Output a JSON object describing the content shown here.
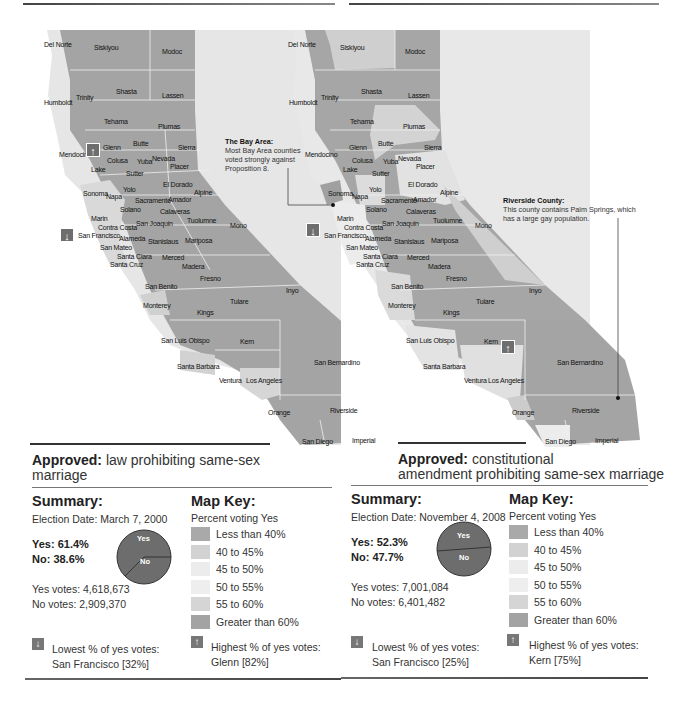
{
  "maps": [
    {
      "id": "prop22-2000",
      "approved_label": "Approved:",
      "approved_text": "law prohibiting same-sex marriage",
      "summary": {
        "title": "Summary:",
        "election_date": "Election Date: March 7, 2000",
        "yes_pct": "Yes: 61.4%",
        "no_pct": "No:  38.6%",
        "yes_votes": "Yes votes: 4,618,673",
        "no_votes": "No votes:  2,909,370",
        "pie_yes_label": "Yes",
        "pie_no_label": "No",
        "pie_yes_value": 61.4,
        "pie_no_value": 38.6
      },
      "key": {
        "title": "Map Key:",
        "subtitle": "Percent voting Yes"
      },
      "lowest": {
        "label": "Lowest % of yes votes:",
        "value": "San Francisco [32%]"
      },
      "highest": {
        "label": "Highest % of yes votes:",
        "value": "Glenn [82%]"
      },
      "markers": {
        "up_county": "Glenn",
        "down_county": "San Francisco"
      }
    },
    {
      "id": "prop8-2008",
      "approved_label": "Approved:",
      "approved_text_line1": "constitutional",
      "approved_text_line2": "amendment prohibiting same-sex marriage",
      "summary": {
        "title": "Summary:",
        "election_date": "Election Date: November 4, 2008",
        "yes_pct": "Yes: 52.3%",
        "no_pct": "No:  47.7%",
        "yes_votes": "Yes votes: 7,001,084",
        "no_votes": "No votes:  6,401,482",
        "pie_yes_label": "Yes",
        "pie_no_label": "No",
        "pie_yes_value": 52.3,
        "pie_no_value": 47.7
      },
      "key": {
        "title": "Map Key:",
        "subtitle": "Percent voting Yes"
      },
      "lowest": {
        "label": "Lowest % of yes votes:",
        "value": "San Francisco [25%]"
      },
      "highest": {
        "label": "Highest % of yes votes:",
        "value": "Kern [75%]"
      },
      "markers": {
        "up_county": "Kern",
        "down_county": "San Francisco"
      },
      "annotations": {
        "bay_area": {
          "title": "The Bay Area:",
          "text": "Most Bay Area counties voted strongly against Proposition 8."
        },
        "riverside": {
          "title": "Riverside County:",
          "text": "This county contains Palm Springs, which has a large gay population."
        }
      }
    }
  ],
  "legend": [
    {
      "label": "Less than 40%",
      "color": "#a9a9a9"
    },
    {
      "label": "40 to 45%",
      "color": "#d2d2d2"
    },
    {
      "label": "45 to 50%",
      "color": "#ececec"
    },
    {
      "label": "50 to 55%",
      "color": "#eeeeee"
    },
    {
      "label": "55 to 60%",
      "color": "#d5d5d5"
    },
    {
      "label": "Greater than 60%",
      "color": "#a3a3a3"
    }
  ],
  "colors": {
    "county_dark": "#a4a4a4",
    "county_light": "#d6d6d6",
    "county_pale": "#ebebeb",
    "pie": "#6d6d6d",
    "marker": "#6e6e6e"
  },
  "counties": [
    {
      "name": "Del Norte",
      "x1": 44,
      "y1": 41,
      "x2": 288,
      "y2": 41
    },
    {
      "name": "Siskiyou",
      "x1": 94,
      "y1": 44,
      "x2": 340,
      "y2": 44
    },
    {
      "name": "Modoc",
      "x1": 162,
      "y1": 48,
      "x2": 405,
      "y2": 48
    },
    {
      "name": "Humboldt",
      "x1": 44,
      "y1": 99,
      "x2": 289,
      "y2": 99
    },
    {
      "name": "Trinity",
      "x1": 76,
      "y1": 94,
      "x2": 321,
      "y2": 94
    },
    {
      "name": "Shasta",
      "x1": 116,
      "y1": 88,
      "x2": 361,
      "y2": 88
    },
    {
      "name": "Lassen",
      "x1": 162,
      "y1": 92,
      "x2": 408,
      "y2": 92
    },
    {
      "name": "Tehama",
      "x1": 104,
      "y1": 118,
      "x2": 350,
      "y2": 118
    },
    {
      "name": "Plumas",
      "x1": 158,
      "y1": 123,
      "x2": 403,
      "y2": 123
    },
    {
      "name": "Butte",
      "x1": 133,
      "y1": 140,
      "x2": 378,
      "y2": 140
    },
    {
      "name": "Glenn",
      "x1": 103,
      "y1": 144,
      "x2": 349,
      "y2": 144
    },
    {
      "name": "Sierra",
      "x1": 178,
      "y1": 144,
      "x2": 424,
      "y2": 144
    },
    {
      "name": "Mendocino",
      "x1": 59,
      "y1": 151,
      "x2": 305,
      "y2": 151
    },
    {
      "name": "Colusa",
      "x1": 107,
      "y1": 157,
      "x2": 352,
      "y2": 157
    },
    {
      "name": "Yuba",
      "x1": 137,
      "y1": 158,
      "x2": 383,
      "y2": 158
    },
    {
      "name": "Nevada",
      "x1": 152,
      "y1": 155,
      "x2": 398,
      "y2": 155
    },
    {
      "name": "Placer",
      "x1": 170,
      "y1": 163,
      "x2": 416,
      "y2": 163
    },
    {
      "name": "Lake",
      "x1": 91,
      "y1": 166,
      "x2": 343,
      "y2": 166
    },
    {
      "name": "Sutter",
      "x1": 126,
      "y1": 170,
      "x2": 372,
      "y2": 170
    },
    {
      "name": "Yolo",
      "x1": 123,
      "y1": 186,
      "x2": 369,
      "y2": 186
    },
    {
      "name": "El Dorado",
      "x1": 163,
      "y1": 181,
      "x2": 408,
      "y2": 181
    },
    {
      "name": "Sonoma",
      "x1": 83,
      "y1": 190,
      "x2": 328,
      "y2": 190
    },
    {
      "name": "Napa",
      "x1": 106,
      "y1": 193,
      "x2": 352,
      "y2": 193
    },
    {
      "name": "Alpine",
      "x1": 194,
      "y1": 189,
      "x2": 440,
      "y2": 189
    },
    {
      "name": "Sacramento",
      "x1": 135,
      "y1": 197,
      "x2": 381,
      "y2": 197
    },
    {
      "name": "Amador",
      "x1": 168,
      "y1": 196,
      "x2": 413,
      "y2": 196
    },
    {
      "name": "Solano",
      "x1": 120,
      "y1": 206,
      "x2": 366,
      "y2": 206
    },
    {
      "name": "Calaveras",
      "x1": 160,
      "y1": 208,
      "x2": 406,
      "y2": 208
    },
    {
      "name": "Marin",
      "x1": 91,
      "y1": 215,
      "x2": 337,
      "y2": 215
    },
    {
      "name": "Tuolumne",
      "x1": 187,
      "y1": 217,
      "x2": 433,
      "y2": 217
    },
    {
      "name": "Mono",
      "x1": 230,
      "y1": 222,
      "x2": 475,
      "y2": 222
    },
    {
      "name": "Contra Costa",
      "x1": 98,
      "y1": 224,
      "x2": 344,
      "y2": 224
    },
    {
      "name": "San Joaquin",
      "x1": 136,
      "y1": 220,
      "x2": 382,
      "y2": 220
    },
    {
      "name": "San Francisco",
      "x1": 78,
      "y1": 232,
      "x2": 324,
      "y2": 232
    },
    {
      "name": "Alameda",
      "x1": 119,
      "y1": 235,
      "x2": 365,
      "y2": 235
    },
    {
      "name": "Stanislaus",
      "x1": 148,
      "y1": 238,
      "x2": 394,
      "y2": 238
    },
    {
      "name": "Mariposa",
      "x1": 185,
      "y1": 237,
      "x2": 431,
      "y2": 237
    },
    {
      "name": "San Mateo",
      "x1": 100,
      "y1": 244,
      "x2": 346,
      "y2": 244
    },
    {
      "name": "Santa Clara",
      "x1": 117,
      "y1": 253,
      "x2": 363,
      "y2": 253
    },
    {
      "name": "Merced",
      "x1": 162,
      "y1": 254,
      "x2": 407,
      "y2": 254
    },
    {
      "name": "Santa Cruz",
      "x1": 110,
      "y1": 261,
      "x2": 356,
      "y2": 261
    },
    {
      "name": "Madera",
      "x1": 182,
      "y1": 263,
      "x2": 428,
      "y2": 263
    },
    {
      "name": "Fresno",
      "x1": 200,
      "y1": 275,
      "x2": 446,
      "y2": 275
    },
    {
      "name": "San Benito",
      "x1": 145,
      "y1": 283,
      "x2": 391,
      "y2": 283
    },
    {
      "name": "Inyo",
      "x1": 286,
      "y1": 287,
      "x2": 529,
      "y2": 287
    },
    {
      "name": "Tulare",
      "x1": 230,
      "y1": 298,
      "x2": 476,
      "y2": 298
    },
    {
      "name": "Monterey",
      "x1": 143,
      "y1": 302,
      "x2": 388,
      "y2": 302
    },
    {
      "name": "Kings",
      "x1": 197,
      "y1": 309,
      "x2": 443,
      "y2": 309
    },
    {
      "name": "San Luis Obispo",
      "x1": 161,
      "y1": 337,
      "x2": 406,
      "y2": 337
    },
    {
      "name": "Kern",
      "x1": 240,
      "y1": 338,
      "x2": 484,
      "y2": 338
    },
    {
      "name": "San Bernardino",
      "x1": 314,
      "y1": 359,
      "x2": 557,
      "y2": 359
    },
    {
      "name": "Santa Barbara",
      "x1": 177,
      "y1": 363,
      "x2": 423,
      "y2": 363
    },
    {
      "name": "Ventura",
      "x1": 219,
      "y1": 377,
      "x2": 464,
      "y2": 377
    },
    {
      "name": "Los Angeles",
      "x1": 246,
      "y1": 377,
      "x2": 488,
      "y2": 377
    },
    {
      "name": "Riverside",
      "x1": 330,
      "y1": 407,
      "x2": 572,
      "y2": 407
    },
    {
      "name": "Orange",
      "x1": 268,
      "y1": 409,
      "x2": 512,
      "y2": 409
    },
    {
      "name": "San Diego",
      "x1": 302,
      "y1": 438,
      "x2": 545,
      "y2": 438
    },
    {
      "name": "Imperial",
      "x1": 352,
      "y1": 437,
      "x2": 595,
      "y2": 437
    }
  ]
}
